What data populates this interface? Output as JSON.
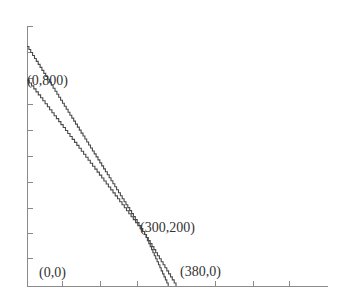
{
  "chart_data": {
    "type": "line",
    "title": "",
    "xlabel": "",
    "ylabel": "",
    "grid": false,
    "legend": null,
    "xlim": [
      0,
      1000
    ],
    "ylim": [
      0,
      1000
    ],
    "series": [
      {
        "name": "constraint-line-1",
        "points": [
          [
            0,
            930
          ],
          [
            300,
            200
          ],
          [
            380,
            0
          ]
        ]
      },
      {
        "name": "constraint-line-2",
        "points": [
          [
            0,
            800
          ],
          [
            300,
            200
          ],
          [
            360,
            0
          ]
        ]
      }
    ],
    "annotations": [
      {
        "text": "(0,800)",
        "x": 0,
        "y": 800
      },
      {
        "text": "(300,200)",
        "x": 300,
        "y": 200
      },
      {
        "text": "(0,0)",
        "x": 0,
        "y": 0
      },
      {
        "text": "(380,0)",
        "x": 380,
        "y": 0
      }
    ],
    "x_ticks_count": 7,
    "y_ticks_count": 10
  },
  "labels": {
    "p_0_800": "(0,800)",
    "p_300_200": "(300,200)",
    "p_0_0": "(0,0)",
    "p_380_0": "(380,0)"
  },
  "colors": {
    "axis": "#888888",
    "line": "#444444",
    "text": "#333333"
  }
}
